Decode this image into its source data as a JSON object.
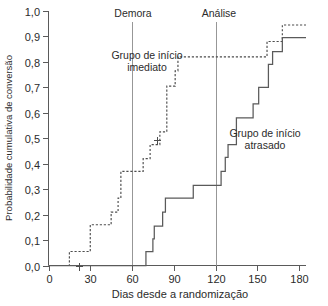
{
  "chart_data": {
    "type": "line",
    "title": "",
    "xlabel": "Dias desde a randomização",
    "ylabel": "Probabilidade cumulativa de conversão",
    "xlim": [
      0,
      185
    ],
    "ylim": [
      0,
      1.0
    ],
    "grid": false,
    "legend_position": "inline-annotations",
    "x_ticks": [
      0,
      30,
      60,
      90,
      120,
      150,
      180
    ],
    "x_tick_labels": [
      "0",
      "30",
      "60",
      "90",
      "120",
      "150",
      "180"
    ],
    "y_ticks": [
      0.0,
      0.1,
      0.2,
      0.3,
      0.4,
      0.5,
      0.6,
      0.7,
      0.8,
      0.9,
      1.0
    ],
    "y_tick_labels": [
      "0,0",
      "0,1",
      "0,2",
      "0,3",
      "0,4",
      "0,5",
      "0,6",
      "0,7",
      "0,8",
      "0,9",
      "1,0"
    ],
    "annotations": [
      {
        "name": "demora",
        "label": "Demora",
        "x": 60,
        "type": "vertical-reference-line"
      },
      {
        "name": "analise",
        "label": "Análise",
        "x": 120,
        "type": "vertical-reference-line"
      }
    ],
    "series": [
      {
        "name": "Grupo de início imediato",
        "style": "dashed",
        "label_lines": [
          "Grupo de início",
          "imediato"
        ],
        "steps": [
          [
            0,
            0.0
          ],
          [
            15,
            0.0
          ],
          [
            15,
            0.055
          ],
          [
            30,
            0.055
          ],
          [
            30,
            0.11
          ],
          [
            30,
            0.16
          ],
          [
            45,
            0.16
          ],
          [
            45,
            0.21
          ],
          [
            50,
            0.21
          ],
          [
            50,
            0.265
          ],
          [
            52,
            0.265
          ],
          [
            52,
            0.37
          ],
          [
            68,
            0.37
          ],
          [
            68,
            0.42
          ],
          [
            73,
            0.42
          ],
          [
            73,
            0.475
          ],
          [
            80,
            0.475
          ],
          [
            80,
            0.525
          ],
          [
            85,
            0.525
          ],
          [
            85,
            0.705
          ],
          [
            91,
            0.705
          ],
          [
            91,
            0.765
          ],
          [
            93,
            0.765
          ],
          [
            93,
            0.82
          ],
          [
            157,
            0.82
          ],
          [
            157,
            0.88
          ],
          [
            168,
            0.88
          ],
          [
            168,
            0.945
          ],
          [
            185,
            0.945
          ]
        ],
        "censored": [
          [
            22,
            0.0
          ],
          [
            78,
            0.495
          ]
        ]
      },
      {
        "name": "Grupo de início atrasado",
        "style": "solid",
        "label_lines": [
          "Grupo de início",
          "atrasado"
        ],
        "steps": [
          [
            0,
            0.0
          ],
          [
            70,
            0.0
          ],
          [
            70,
            0.055
          ],
          [
            75,
            0.055
          ],
          [
            75,
            0.105
          ],
          [
            76,
            0.105
          ],
          [
            76,
            0.155
          ],
          [
            82,
            0.155
          ],
          [
            82,
            0.21
          ],
          [
            84,
            0.21
          ],
          [
            84,
            0.265
          ],
          [
            104,
            0.265
          ],
          [
            104,
            0.315
          ],
          [
            124,
            0.315
          ],
          [
            124,
            0.37
          ],
          [
            127,
            0.37
          ],
          [
            127,
            0.425
          ],
          [
            129,
            0.425
          ],
          [
            129,
            0.475
          ],
          [
            135,
            0.475
          ],
          [
            135,
            0.58
          ],
          [
            147,
            0.58
          ],
          [
            147,
            0.635
          ],
          [
            151,
            0.635
          ],
          [
            151,
            0.7
          ],
          [
            158,
            0.7
          ],
          [
            158,
            0.79
          ],
          [
            161,
            0.79
          ],
          [
            161,
            0.84
          ],
          [
            168,
            0.84
          ],
          [
            168,
            0.895
          ],
          [
            185,
            0.895
          ]
        ],
        "censored": []
      }
    ]
  },
  "axis": {
    "x_title": "Dias desde a randomização",
    "y_title": "Probabilidade cumulativa de conversão"
  },
  "reference_lines": {
    "demora_label": "Demora",
    "analise_label": "Análise"
  },
  "series_labels": {
    "immediate_line1": "Grupo de início",
    "immediate_line2": "imediato",
    "delayed_line1": "Grupo de início",
    "delayed_line2": "atrasado"
  },
  "y_tick_labels": {
    "t0": "0,0",
    "t1": "0,1",
    "t2": "0,2",
    "t3": "0,3",
    "t4": "0,4",
    "t5": "0,5",
    "t6": "0,6",
    "t7": "0,7",
    "t8": "0,8",
    "t9": "0,9",
    "t10": "1,0"
  },
  "x_tick_labels": {
    "t0": "0",
    "t1": "30",
    "t2": "60",
    "t3": "90",
    "t4": "120",
    "t5": "150",
    "t6": "180"
  },
  "colors": {
    "axis": "#5a5a5a",
    "curve": "#4d4d4d",
    "reference": "#8c8c8c",
    "text": "#2b2b2b",
    "background": "#ffffff"
  }
}
